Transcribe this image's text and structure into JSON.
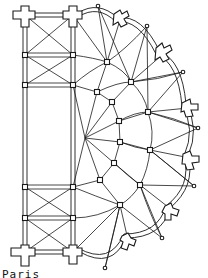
{
  "diagram": {
    "caption": "Paris",
    "colors": {
      "line": "#1a1a1a",
      "background": "#ffffff"
    },
    "elements": {
      "straight_bays": 2,
      "radiating_buttresses": 6,
      "outer_wall_columns": 7,
      "ambulatory_rings": 2
    }
  }
}
